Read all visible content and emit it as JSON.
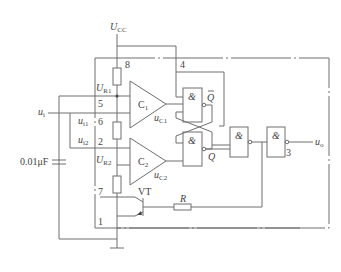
{
  "diagram": {
    "supply": {
      "label_main": "U",
      "label_sub": "CC"
    },
    "pins": {
      "p8": "8",
      "p4": "4",
      "p5": "5",
      "p6": "6",
      "p2": "2",
      "p7": "7",
      "p1": "1",
      "p3": "3"
    },
    "reference_labels": {
      "ur1_main": "U",
      "ur1_sub": "R1",
      "ur2_main": "U",
      "ur2_sub": "R2"
    },
    "inputs": {
      "ui_main": "u",
      "ui_sub": "i",
      "ui1_main": "u",
      "ui1_sub": "i1",
      "ui2_main": "u",
      "ui2_sub": "i2"
    },
    "comparators": [
      {
        "label_main": "C",
        "label_sub": "1",
        "out_main": "u",
        "out_sub": "C1"
      },
      {
        "label_main": "C",
        "label_sub": "2",
        "out_main": "u",
        "out_sub": "C2"
      }
    ],
    "gates": {
      "and_symbol": "&",
      "q_bar": "Q",
      "q": "Q"
    },
    "transistor": {
      "label": "VT"
    },
    "resistor": {
      "label": "R"
    },
    "capacitor": {
      "label": "0.01μF"
    },
    "output": {
      "label_main": "u",
      "label_sub": "o"
    }
  }
}
